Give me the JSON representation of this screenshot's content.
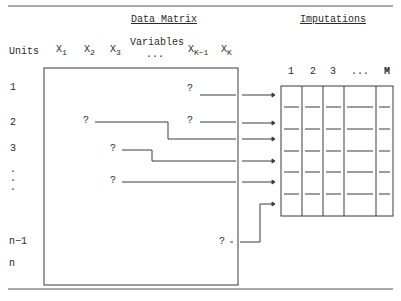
{
  "titles": {
    "data_matrix": "Data Matrix",
    "imputations": "Imputations",
    "variables": "Variables",
    "units": "Units"
  },
  "variable_headers": [
    {
      "base": "X",
      "sub": "1"
    },
    {
      "base": "X",
      "sub": "2"
    },
    {
      "base": "X",
      "sub": "3"
    },
    {
      "base": "...",
      "sub": ""
    },
    {
      "base": "X",
      "sub": "K−1"
    },
    {
      "base": "X",
      "sub": "K"
    }
  ],
  "unit_labels": [
    "1",
    "2",
    "3",
    ".",
    ".",
    ".",
    "n−1",
    "n"
  ],
  "imputation_headers": [
    "1",
    "2",
    "3",
    "...",
    "M"
  ],
  "missing_marker": "?",
  "missing_cells": [
    {
      "row": "1",
      "column": "X_{K-1}"
    },
    {
      "row": "2",
      "column": "X_2"
    },
    {
      "row": "2",
      "column": "X_{K-1}"
    },
    {
      "row": "3",
      "column": "X_3"
    },
    {
      "row": ".",
      "column": "X_3"
    },
    {
      "row": "n−1",
      "column": "X_K"
    }
  ],
  "imputation_rows": 6,
  "colors": {
    "line": "#3a3a3a",
    "text": "#2a2a2a",
    "background": "#ffffff"
  }
}
